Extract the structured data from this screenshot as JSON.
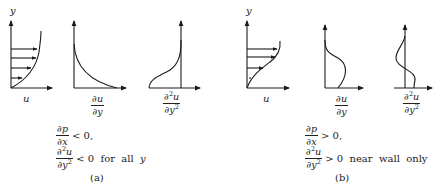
{
  "figure": {
    "panel_a": {
      "axis_y_label": "y",
      "plot_labels": {
        "velocity": "u",
        "first_derivative": {
          "num": "∂u",
          "den": "∂y"
        },
        "second_derivative": {
          "num": "∂",
          "num_sup": "2",
          "num_tail": "u",
          "den": "∂y",
          "den_sup": "2"
        }
      },
      "conditions": [
        {
          "num": "∂p",
          "den": "∂x",
          "relation": "< 0,"
        },
        {
          "num": "∂",
          "num_sup": "2",
          "num_tail": "u",
          "den": "∂y",
          "den_sup": "2",
          "relation": "< 0  for  all  ",
          "relation_var": "y"
        }
      ],
      "caption": "(a)",
      "description": "Favorable pressure gradient: velocity profile, monotonically decreasing du/dy, negative d2u/dy2 everywhere"
    },
    "panel_b": {
      "axis_y_label": "y",
      "plot_labels": {
        "velocity": "u",
        "first_derivative": {
          "num": "∂u",
          "den": "∂y"
        },
        "second_derivative": {
          "num": "∂",
          "num_sup": "2",
          "num_tail": "u",
          "den": "∂y",
          "den_sup": "2"
        }
      },
      "conditions": [
        {
          "num": "∂p",
          "den": "∂x",
          "relation": "> 0,"
        },
        {
          "num": "∂",
          "num_sup": "2",
          "num_tail": "u",
          "den": "∂y",
          "den_sup": "2",
          "relation": "> 0  near  wall  only",
          "relation_var": ""
        }
      ],
      "caption": "(b)",
      "description": "Adverse pressure gradient: inflected velocity profile, du/dy with maximum away from wall, d2u/dy2 changes sign"
    },
    "stroke_color": "#1a1a1a",
    "background": "#ffffff"
  }
}
